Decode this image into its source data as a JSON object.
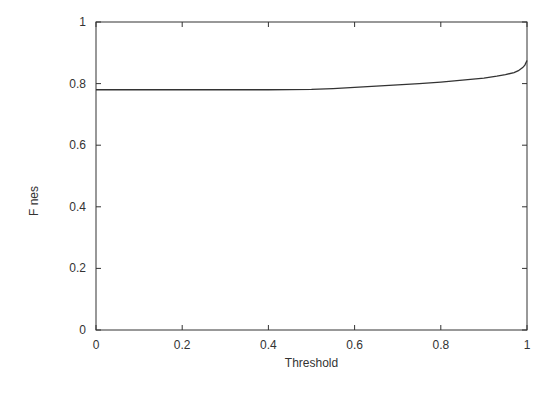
{
  "chart_data": {
    "type": "line",
    "title": "",
    "xlabel": "Threshold",
    "ylabel": "F  nes",
    "xlim": [
      0,
      1
    ],
    "ylim": [
      0,
      1
    ],
    "xticks": [
      "0",
      "0.2",
      "0.4",
      "0.6",
      "0.8",
      "1"
    ],
    "yticks": [
      "0",
      "0.2",
      "0.4",
      "0.6",
      "0.8",
      "1"
    ],
    "grid": false,
    "legend": null,
    "series": [
      {
        "name": "curve",
        "color": "#333333",
        "x": [
          0,
          0.1,
          0.2,
          0.3,
          0.4,
          0.5,
          0.55,
          0.6,
          0.65,
          0.7,
          0.75,
          0.8,
          0.85,
          0.9,
          0.93,
          0.95,
          0.97,
          0.98,
          0.99,
          0.995,
          1.0
        ],
        "y": [
          0.78,
          0.78,
          0.78,
          0.78,
          0.78,
          0.781,
          0.784,
          0.788,
          0.792,
          0.796,
          0.8,
          0.805,
          0.811,
          0.818,
          0.824,
          0.829,
          0.836,
          0.842,
          0.852,
          0.86,
          0.875
        ]
      }
    ]
  }
}
